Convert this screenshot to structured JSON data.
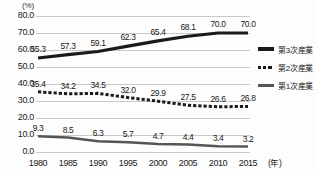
{
  "chart_data": {
    "type": "line",
    "title": "",
    "xlabel": "年",
    "ylabel": "(%)",
    "unit_label": "(%)",
    "x_unit_label": "(年)",
    "categories": [
      "1980",
      "1985",
      "1990",
      "1995",
      "2000",
      "2005",
      "2010",
      "2015"
    ],
    "ylim": [
      0.0,
      80.0
    ],
    "yticks": [
      "0.0",
      "10.0",
      "20.0",
      "30.0",
      "40.0",
      "50.0",
      "60.0",
      "70.0",
      "80.0"
    ],
    "ytick_values": [
      0.0,
      10.0,
      20.0,
      30.0,
      40.0,
      50.0,
      60.0,
      70.0,
      80.0
    ],
    "grid": true,
    "legend_position": "right",
    "series": [
      {
        "name": "第3次産業",
        "style": "solid-thick",
        "color": "#1a1a1a",
        "values": [
          55.3,
          57.3,
          59.1,
          62.3,
          65.4,
          68.1,
          70.0,
          70.0
        ],
        "labels": [
          "55.3",
          "57.3",
          "59.1",
          "62.3",
          "65.4",
          "68.1",
          "70.0",
          "70.0"
        ]
      },
      {
        "name": "第2次産業",
        "style": "dotted",
        "color": "#1a1a1a",
        "values": [
          35.4,
          34.2,
          34.5,
          32.0,
          29.9,
          27.5,
          26.6,
          26.8
        ],
        "labels": [
          "35.4",
          "34.2",
          "34.5",
          "32.0",
          "29.9",
          "27.5",
          "26.6",
          "26.8"
        ]
      },
      {
        "name": "第1次産業",
        "style": "solid-medium",
        "color": "#555555",
        "values": [
          9.3,
          8.5,
          6.3,
          5.7,
          4.7,
          4.4,
          3.4,
          3.2
        ],
        "labels": [
          "9.3",
          "8.5",
          "6.3",
          "5.7",
          "4.7",
          "4.4",
          "3.4",
          "3.2"
        ]
      }
    ]
  },
  "legend": {
    "items": [
      {
        "label": "第3次産業",
        "swatch": "solid-thick"
      },
      {
        "label": "第2次産業",
        "swatch": "dotted"
      },
      {
        "label": "第1次産業",
        "swatch": "solid-medium"
      }
    ]
  }
}
